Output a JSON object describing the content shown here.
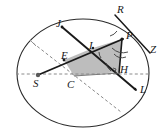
{
  "figure": {
    "type": "geometry-diagram",
    "width": 166,
    "height": 139,
    "background_color": "#ffffff",
    "stroke_color": "#1a1a1a",
    "shade_color": "#b8b8b8",
    "dash_color": "#8c8c8c"
  },
  "points": [
    {
      "id": "R",
      "label": "R",
      "x": 122,
      "y": 11,
      "label_x": 117,
      "label_y": 4
    },
    {
      "id": "J",
      "label": "J",
      "x": 62,
      "y": 27,
      "label_x": 56,
      "label_y": 18
    },
    {
      "id": "P",
      "label": "P",
      "x": 122,
      "y": 39,
      "label_x": 126,
      "label_y": 30
    },
    {
      "id": "Z",
      "label": "Z",
      "x": 152,
      "y": 54,
      "label_x": 150,
      "label_y": 44
    },
    {
      "id": "I",
      "label": "I",
      "x": 93,
      "y": 48,
      "label_x": 89,
      "label_y": 41
    },
    {
      "id": "E",
      "label": "E",
      "x": 64,
      "y": 60,
      "label_x": 62,
      "label_y": 52
    },
    {
      "id": "H",
      "label": "H",
      "x": 119,
      "y": 72,
      "label_x": 120,
      "label_y": 66
    },
    {
      "id": "S",
      "label": "S",
      "x": 38,
      "y": 75,
      "label_x": 33,
      "label_y": 78
    },
    {
      "id": "C",
      "label": "C",
      "x": 72,
      "y": 76,
      "label_x": 68,
      "label_y": 79
    },
    {
      "id": "L",
      "label": "L",
      "x": 134,
      "y": 89,
      "label_x": 140,
      "label_y": 84
    }
  ],
  "shapes": {
    "ellipse": {
      "cx": 83,
      "cy": 73,
      "rx": 66,
      "ry": 54
    },
    "shaded_region": "E-I-P-H-C",
    "chords": [
      {
        "name": "chord-J-L",
        "from": "J",
        "to": "L"
      },
      {
        "name": "chord-E-P",
        "from": "E",
        "to": "P"
      },
      {
        "name": "segment-P-H",
        "from": "P",
        "to": "H"
      },
      {
        "name": "line-R-Z",
        "from": "R",
        "to": "Z"
      }
    ],
    "dashed": [
      {
        "name": "horizontal-axis",
        "from": [
          17,
          74
        ],
        "to": [
          149,
          74
        ]
      },
      {
        "name": "dashed-chord-upper-left",
        "from": [
          33,
          43
        ],
        "to": [
          119,
          110
        ]
      },
      {
        "name": "radius-S-C",
        "from": [
          38,
          75
        ],
        "to": [
          72,
          76
        ]
      }
    ],
    "angle_marks": [
      {
        "name": "angle-at-P-upper",
        "at": "P"
      },
      {
        "name": "angle-at-P-lower",
        "at": "P"
      },
      {
        "name": "angle-at-I",
        "at": "I"
      },
      {
        "name": "angle-at-H",
        "at": "H"
      }
    ]
  }
}
